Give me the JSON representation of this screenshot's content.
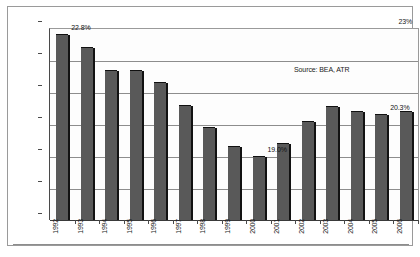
{
  "chart_data": {
    "type": "bar",
    "title": "",
    "subtitle": "",
    "xlabel": "",
    "ylabel": "",
    "ylim": [
      17,
      23
    ],
    "yticks": [
      "17%",
      "18%",
      "19%",
      "20%",
      "21%",
      "22%",
      "23%"
    ],
    "grid": true,
    "legend": false,
    "categories": [
      "1992",
      "1993",
      "1994",
      "1995",
      "1996",
      "1997",
      "1998",
      "1999",
      "2000",
      "2001",
      "2002",
      "2003",
      "2004",
      "2005",
      "2006"
    ],
    "values": [
      22.8,
      22.4,
      21.7,
      21.7,
      21.3,
      20.6,
      19.9,
      19.3,
      19.0,
      19.4,
      20.1,
      20.55,
      20.4,
      20.3,
      20.4
    ],
    "annotations": [
      {
        "category": "1992",
        "text": "22.8%"
      },
      {
        "category": "2000",
        "text": "19.0%"
      },
      {
        "category": "2005",
        "text": "20.3%"
      }
    ],
    "source_note": "Source: BEA, ATR",
    "colors": {
      "bar_fill": "#595959",
      "bar_edge": "#121212",
      "gridline": "#8d8d8d",
      "axis": "#4a4a4a",
      "text": "#1a1a1a",
      "background": "#ffffff"
    }
  },
  "axis": {
    "y_labels": [
      "23%",
      "22%",
      "21%",
      "20%",
      "19%",
      "18%",
      "17%"
    ],
    "x_labels": [
      "1992",
      "1993",
      "1994",
      "1995",
      "1996",
      "1997",
      "1998",
      "1999",
      "2000",
      "2001",
      "2002",
      "2003",
      "2004",
      "2005",
      "2006"
    ]
  },
  "labels": {
    "first_peak": "22.8%",
    "trough": "19.0%",
    "late_peak": "20.3%"
  },
  "footer": {
    "source": "Source: BEA, ATR"
  }
}
